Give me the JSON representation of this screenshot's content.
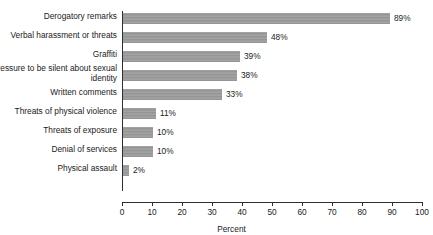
{
  "top_caption": "",
  "chart_data": {
    "type": "bar",
    "orientation": "horizontal",
    "title": "",
    "xlabel": "Percent",
    "ylabel": "",
    "xlim": [
      0,
      100
    ],
    "xticks": [
      0,
      10,
      20,
      30,
      40,
      50,
      60,
      70,
      80,
      90,
      100
    ],
    "grid": false,
    "legend": "none",
    "value_suffix": "%",
    "bar_color": "#9a9a9a",
    "axis_color": "#2e2e2e",
    "categories": [
      "Derogatory remarks",
      "Verbal harassment or threats",
      "Graffiti",
      "Pressure to be silent about sexual identity",
      "Written comments",
      "Threats of physical violence",
      "Threats of exposure",
      "Denial of services",
      "Physical assault"
    ],
    "values": [
      89,
      48,
      39,
      38,
      33,
      11,
      10,
      10,
      2
    ],
    "value_labels": [
      "89%",
      "48%",
      "39%",
      "38%",
      "33%",
      "11%",
      "10%",
      "10%",
      "2%"
    ]
  }
}
